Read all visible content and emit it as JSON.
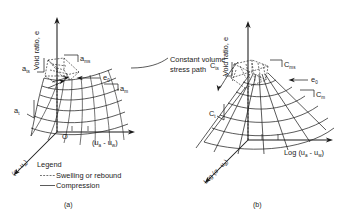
{
  "figure": {
    "panels": [
      {
        "id": "a",
        "caption": "(a)",
        "axes": {
          "vertical": "Void ratio, e",
          "horizontal": "(uₐ - u_w)",
          "horizontal_main": "(u",
          "horizontal_sub1": "a",
          "horizontal_mid": " - u",
          "horizontal_sub2": "w",
          "horizontal_end": ")",
          "depth_main": "(σ - u",
          "depth_sub": "a",
          "depth_end": ")",
          "origin": "O"
        },
        "labels": [
          {
            "name": "a-ts",
            "base": "a",
            "sub": "ts"
          },
          {
            "name": "a-ms",
            "base": "a",
            "sub": "ms"
          },
          {
            "name": "a-m",
            "base": "a",
            "sub": "m"
          },
          {
            "name": "a-t",
            "base": "a",
            "sub": "t"
          },
          {
            "name": "e-0",
            "base": "e",
            "sub": "0"
          }
        ],
        "legend": {
          "title": "Legend",
          "items": [
            {
              "label": "Swelling or rebound",
              "style": "dashed"
            },
            {
              "label": "Compression",
              "style": "solid"
            }
          ]
        }
      },
      {
        "id": "b",
        "caption": "(b)",
        "axes": {
          "vertical": "Void ratio, e",
          "horizontal_prefix": "Log ",
          "horizontal_main": "(u",
          "horizontal_sub1": "a",
          "horizontal_mid": " - u",
          "horizontal_sub2": "w",
          "horizontal_end": ")",
          "depth_prefix": "Log ",
          "depth_main": "(σ - u",
          "depth_sub": "a",
          "depth_end": ")"
        },
        "labels": [
          {
            "name": "C-ts",
            "base": "C",
            "sub": "ts"
          },
          {
            "name": "C-ms",
            "base": "C",
            "sub": "ms"
          },
          {
            "name": "C-m",
            "base": "C",
            "sub": "m"
          },
          {
            "name": "C-t",
            "base": "C",
            "sub": "t"
          },
          {
            "name": "e-0",
            "base": "e",
            "sub": "0"
          }
        ]
      }
    ],
    "annotation": {
      "line1": "Constant volume",
      "line2": "stress path"
    }
  },
  "colors": {
    "ink": "#1a1a1a",
    "background": "#ffffff"
  }
}
